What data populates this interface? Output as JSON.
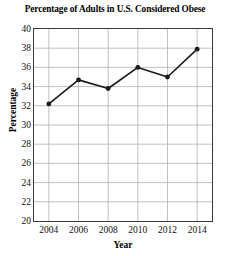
{
  "chart_data": {
    "type": "line",
    "title": "Percentage of Adults in U.S. Considered Obese",
    "xlabel": "Year",
    "ylabel": "Percentage",
    "x": [
      2004,
      2006,
      2008,
      2010,
      2012,
      2014
    ],
    "values": [
      32.2,
      34.7,
      33.8,
      36.0,
      35.0,
      37.9
    ],
    "categories": [
      "2004",
      "2006",
      "2008",
      "2010",
      "2012",
      "2014"
    ],
    "xlim": [
      2003,
      2015
    ],
    "ylim": [
      20,
      40
    ],
    "ytick_labels": [
      "40",
      "38",
      "36",
      "34",
      "32",
      "30",
      "28",
      "26",
      "24",
      "22",
      "20"
    ],
    "ytick_values": [
      40,
      38,
      36,
      34,
      32,
      30,
      28,
      26,
      24,
      22,
      20
    ],
    "xtick_labels": [
      "2004",
      "2006",
      "2008",
      "2010",
      "2012",
      "2014"
    ],
    "xtick_values": [
      2004,
      2006,
      2008,
      2010,
      2012,
      2014
    ],
    "grid": true,
    "legend": null,
    "line_color": "#1a1a1a",
    "marker_color": "#1a1a1a",
    "grid_color": "#b3b3b3",
    "axis_color": "#3a3a3a",
    "background_color": "#ffffff"
  }
}
